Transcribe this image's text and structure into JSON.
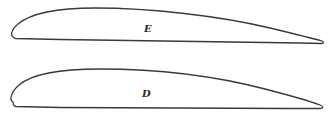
{
  "diagram": {
    "type": "airfoil-profiles",
    "stroke_color": "#3a3a3a",
    "background": "#ffffff",
    "profiles": [
      {
        "id": "E",
        "label": "E",
        "position": "top"
      },
      {
        "id": "D",
        "label": "D",
        "position": "bottom"
      }
    ]
  }
}
